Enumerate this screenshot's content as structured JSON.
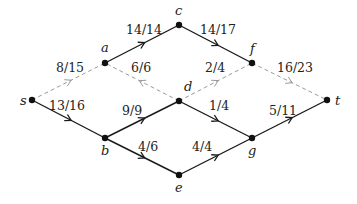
{
  "diagram": {
    "type": "flow-network",
    "colors": {
      "solid_edge": "#1a1a1a",
      "dashed_edge": "#9a9a9a",
      "node": "#111111",
      "text": "#222222"
    },
    "nodes": [
      {
        "id": "s",
        "label": "s",
        "x": 32,
        "y": 100,
        "lx": 20,
        "ly": 105
      },
      {
        "id": "a",
        "label": "a",
        "x": 105,
        "y": 63,
        "lx": 101,
        "ly": 52
      },
      {
        "id": "c",
        "label": "c",
        "x": 179,
        "y": 25,
        "lx": 175,
        "ly": 15
      },
      {
        "id": "f",
        "label": "f",
        "x": 252,
        "y": 63,
        "lx": 250,
        "ly": 53
      },
      {
        "id": "t",
        "label": "t",
        "x": 327,
        "y": 100,
        "lx": 335,
        "ly": 105
      },
      {
        "id": "b",
        "label": "b",
        "x": 105,
        "y": 138,
        "lx": 101,
        "ly": 155
      },
      {
        "id": "d",
        "label": "d",
        "x": 179,
        "y": 101,
        "lx": 184,
        "ly": 91
      },
      {
        "id": "e",
        "label": "e",
        "x": 179,
        "y": 175,
        "lx": 175,
        "ly": 192
      },
      {
        "id": "g",
        "label": "g",
        "x": 252,
        "y": 138,
        "lx": 248,
        "ly": 155
      }
    ],
    "edges": [
      {
        "from": "s",
        "to": "a",
        "label": "8/15",
        "style": "dashed",
        "lx": 56,
        "ly": 72
      },
      {
        "from": "s",
        "to": "b",
        "label": "13/16",
        "style": "solid",
        "lx": 49,
        "ly": 110
      },
      {
        "from": "a",
        "to": "c",
        "label": "14/14",
        "style": "solid",
        "lx": 126,
        "ly": 34
      },
      {
        "from": "d",
        "to": "a",
        "label": "6/6",
        "style": "dashed",
        "lx": 131,
        "ly": 72
      },
      {
        "from": "c",
        "to": "f",
        "label": "14/17",
        "style": "solid",
        "lx": 200,
        "ly": 34
      },
      {
        "from": "d",
        "to": "f",
        "label": "2/4",
        "style": "dashed",
        "lx": 205,
        "ly": 72
      },
      {
        "from": "f",
        "to": "t",
        "label": "16/23",
        "style": "dashed",
        "lx": 277,
        "ly": 72
      },
      {
        "from": "b",
        "to": "d",
        "label": "9/9",
        "style": "solid",
        "lx": 122,
        "ly": 115
      },
      {
        "from": "b",
        "to": "e",
        "label": "4/6",
        "style": "solid",
        "lx": 138,
        "ly": 151
      },
      {
        "from": "d",
        "to": "g",
        "label": "1/4",
        "style": "solid",
        "lx": 209,
        "ly": 110
      },
      {
        "from": "e",
        "to": "g",
        "label": "4/4",
        "style": "solid",
        "lx": 192,
        "ly": 151
      },
      {
        "from": "g",
        "to": "t",
        "label": "5/11",
        "style": "solid",
        "lx": 269,
        "ly": 115
      }
    ]
  }
}
